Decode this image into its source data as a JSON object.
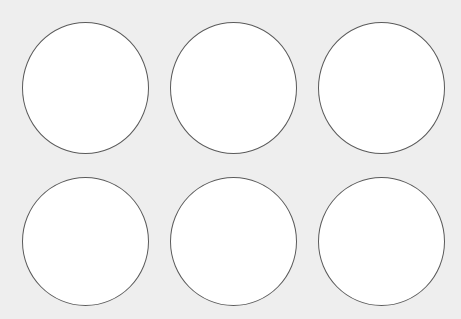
{
  "sheet": {
    "background": "#eeeeee",
    "label_fill": "#ffffff",
    "label_stroke": "#5a5a5a",
    "rows": 2,
    "columns": 3,
    "labels": [
      {
        "row": 1,
        "col": 1,
        "x": 22,
        "y": 22,
        "w": 127,
        "h": 132
      },
      {
        "row": 1,
        "col": 2,
        "x": 170,
        "y": 22,
        "w": 127,
        "h": 132
      },
      {
        "row": 1,
        "col": 3,
        "x": 318,
        "y": 22,
        "w": 127,
        "h": 132
      },
      {
        "row": 2,
        "col": 1,
        "x": 22,
        "y": 177,
        "w": 127,
        "h": 129
      },
      {
        "row": 2,
        "col": 2,
        "x": 170,
        "y": 177,
        "w": 127,
        "h": 129
      },
      {
        "row": 2,
        "col": 3,
        "x": 318,
        "y": 177,
        "w": 127,
        "h": 129
      }
    ]
  }
}
